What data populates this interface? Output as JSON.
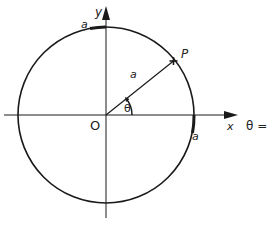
{
  "diagram": {
    "colors": {
      "stroke": "#1a1a1a",
      "background": "#ffffff"
    },
    "labels": {
      "y_axis": "y",
      "x_axis": "x",
      "origin": "O",
      "point": "P",
      "radius": "a",
      "angle": "θ",
      "arc_top": "a",
      "arc_right": "a",
      "theta_zero": "θ = 0"
    },
    "geometry": {
      "center": [
        106,
        115
      ],
      "radius": 88,
      "point_angle_deg": 40
    }
  }
}
